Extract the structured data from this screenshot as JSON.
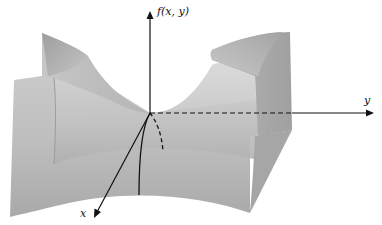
{
  "figure": {
    "axes": {
      "vertical_label": "f(x, y)",
      "y_label": "y",
      "x_label": "x"
    },
    "colors": {
      "surface_light": "#d4d4d4",
      "surface_mid": "#b8b8b8",
      "surface_dark": "#9a9a9a",
      "axis": "#111111",
      "background": "#ffffff"
    }
  }
}
